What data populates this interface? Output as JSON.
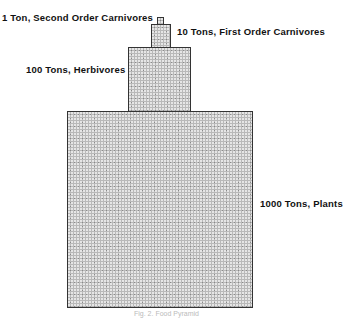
{
  "diagram": {
    "title": "Food Pyramid",
    "levels": [
      {
        "name": "second-order-carnivores",
        "label": "1 Ton, Second Order Carnivores",
        "tons": 1
      },
      {
        "name": "first-order-carnivores",
        "label": "10 Tons, First Order Carnivores",
        "tons": 10
      },
      {
        "name": "herbivores",
        "label": "100 Tons, Herbivores",
        "tons": 100
      },
      {
        "name": "plants",
        "label": "1000 Tons, Plants",
        "tons": 1000
      }
    ],
    "caption": "Fig. 2. Food Pyramid"
  }
}
